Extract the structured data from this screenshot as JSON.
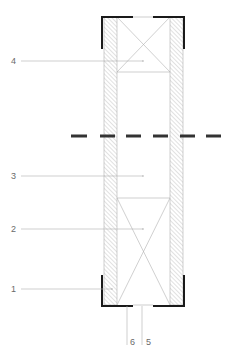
{
  "diagram": {
    "type": "technical-section-drawing",
    "colors": {
      "bracket": "#1a1a1a",
      "centerline": "#333333",
      "hatch": "#b5b5b5",
      "thin_line": "#b0b0b0",
      "label": "#6a6a6a",
      "background": "#ffffff"
    },
    "labels": [
      {
        "id": "1",
        "text": "1",
        "x": 11,
        "y": 284,
        "target": {
          "x": 112,
          "y": 289
        }
      },
      {
        "id": "2",
        "text": "2",
        "x": 11,
        "y": 224,
        "target": {
          "x": 143,
          "y": 229
        }
      },
      {
        "id": "3",
        "text": "3",
        "x": 11,
        "y": 171,
        "target": {
          "x": 143,
          "y": 176
        }
      },
      {
        "id": "4",
        "text": "4",
        "x": 11,
        "y": 56,
        "target": {
          "x": 143,
          "y": 61
        }
      },
      {
        "id": "5",
        "text": "5",
        "x": 146,
        "y": 337
      },
      {
        "id": "6",
        "text": "6",
        "x": 130,
        "y": 337
      }
    ],
    "centerline": {
      "y": 136,
      "dash": 16,
      "gap": 11
    }
  }
}
